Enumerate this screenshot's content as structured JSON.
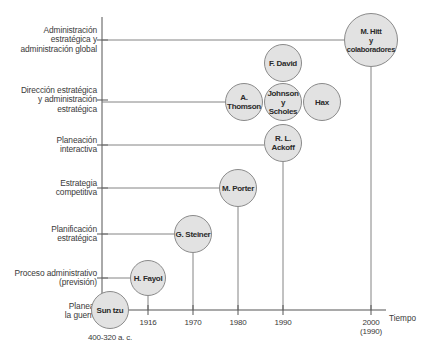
{
  "diagram": {
    "type": "timeline",
    "x_axis_label": "Tiempo",
    "levels": [
      {
        "id": "admin-estrategica",
        "label": "Administración\nestratégica y\nadministración global",
        "y": 40
      },
      {
        "id": "direccion-estrategica",
        "label": "Dirección estratégica\ny administración\nestratégica",
        "y": 100
      },
      {
        "id": "planeacion-interactiva",
        "label": "Planeación\ninteractiva",
        "y": 145
      },
      {
        "id": "estrategia-competitiva",
        "label": "Estrategia\ncompetitiva",
        "y": 188
      },
      {
        "id": "planificacion-estrategica",
        "label": "Planificación\nestratégica",
        "y": 234
      },
      {
        "id": "proceso-administrativo",
        "label": "Proceso administrativo\n(previsión)",
        "y": 278
      },
      {
        "id": "planear-guerra",
        "label": "Planear\nla guerra",
        "y": 309
      }
    ],
    "years": [
      {
        "label": "400-320 a. c.",
        "x": 110
      },
      {
        "label": "1916",
        "x": 148
      },
      {
        "label": "1970",
        "x": 193
      },
      {
        "label": "1980",
        "x": 238
      },
      {
        "label": "1990",
        "x": 283
      },
      {
        "label": "2000\n(1990)",
        "x": 371
      }
    ],
    "nodes": [
      {
        "id": "sun-tzu",
        "label": "Sun tzu",
        "cx": 110,
        "cy": 310,
        "r": 19,
        "level": "planear-guerra",
        "year": "400-320 a. c."
      },
      {
        "id": "h-fayol",
        "label": "H. Fayol",
        "cx": 148,
        "cy": 278,
        "r": 18,
        "level": "proceso-administrativo",
        "year": "1916"
      },
      {
        "id": "g-steiner",
        "label": "G. Steiner",
        "cx": 193,
        "cy": 234,
        "r": 19,
        "level": "planificacion-estrategica",
        "year": "1970"
      },
      {
        "id": "m-porter",
        "label": "M. Porter",
        "cx": 238,
        "cy": 188,
        "r": 19,
        "level": "estrategia-competitiva",
        "year": "1980"
      },
      {
        "id": "rl-ackoff",
        "label": "R. L.\nAckoff",
        "cx": 283,
        "cy": 143,
        "r": 19,
        "level": "planeacion-interactiva",
        "year": "1990"
      },
      {
        "id": "a-thomson",
        "label": "A.\nThomson",
        "cx": 244,
        "cy": 102,
        "r": 19,
        "level": "direccion-estrategica",
        "year": "1990"
      },
      {
        "id": "johnson-scholes",
        "label": "Johnson\ny\nScholes",
        "cx": 283,
        "cy": 102,
        "r": 19,
        "level": "direccion-estrategica",
        "year": "1990"
      },
      {
        "id": "hax",
        "label": "Hax",
        "cx": 322,
        "cy": 102,
        "r": 19,
        "level": "direccion-estrategica",
        "year": "1990"
      },
      {
        "id": "f-david",
        "label": "F. David",
        "cx": 283,
        "cy": 63,
        "r": 19,
        "level": "direccion-estrategica",
        "year": "1990"
      },
      {
        "id": "m-hitt",
        "label": "M. Hitt\ny\ncolaboradores",
        "cx": 371,
        "cy": 40,
        "r": 27,
        "level": "admin-estrategica",
        "year": "2000 (1990)"
      }
    ]
  }
}
